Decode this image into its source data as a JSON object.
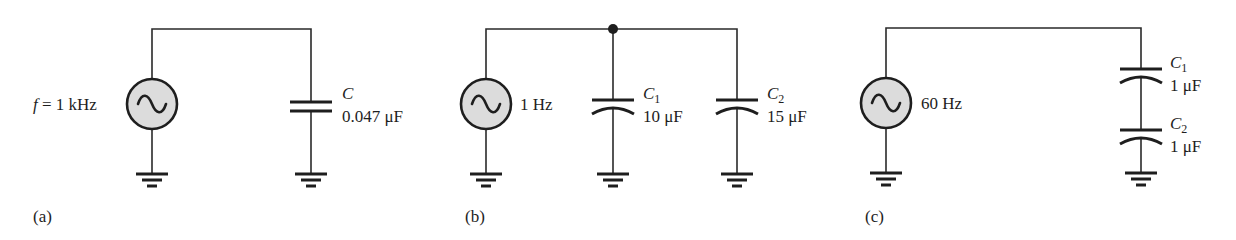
{
  "figure": {
    "panels": [
      {
        "id": "a",
        "label": "(a)",
        "source": {
          "prefix": "f",
          "text": " = 1 kHz"
        },
        "capacitors": [
          {
            "name": "C",
            "sub": "",
            "value": "0.047 μF"
          }
        ],
        "topology": "single"
      },
      {
        "id": "b",
        "label": "(b)",
        "source": {
          "text": "1 Hz"
        },
        "capacitors": [
          {
            "name": "C",
            "sub": "1",
            "value": "10 μF"
          },
          {
            "name": "C",
            "sub": "2",
            "value": "15 μF"
          }
        ],
        "topology": "parallel"
      },
      {
        "id": "c",
        "label": "(c)",
        "source": {
          "text": "60 Hz"
        },
        "capacitors": [
          {
            "name": "C",
            "sub": "1",
            "value": "1 μF"
          },
          {
            "name": "C",
            "sub": "2",
            "value": "1 μF"
          }
        ],
        "topology": "series"
      }
    ],
    "colors": {
      "line": "#1e1e1e",
      "source_fill": "#dcdcdc",
      "background": "#ffffff"
    }
  }
}
